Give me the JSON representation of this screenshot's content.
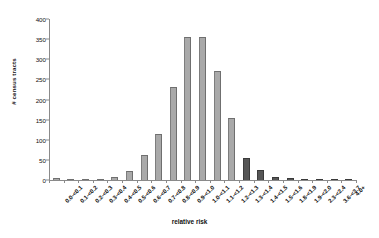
{
  "chart_data": {
    "type": "bar",
    "title": "",
    "xlabel": "relative risk",
    "ylabel": "# census tracts",
    "ylim": [
      0,
      400
    ],
    "yticks": [
      0,
      50,
      100,
      150,
      200,
      250,
      300,
      350,
      400
    ],
    "grid": false,
    "legend": false,
    "categories": [
      "0.0-<0.1",
      "0.1-<0.2",
      "0.2-<0.3",
      "0.3-<0.4",
      "0.4-<0.5",
      "0.5-<0.6",
      "0.6-<0.7",
      "0.7-<0.8",
      "0.8-<0.9",
      "0.9-<1.0",
      "1.0-<1.1",
      "1.1-<1.2",
      "1.2-<1.3",
      "1.3-<1.4",
      "1.4-<1.5",
      "1.5-<1.6",
      "1.8-<1.9",
      "1.9-<2.0",
      "2.3-<2.4",
      "3.6-<3.7",
      "4.0+"
    ],
    "values": [
      4,
      2,
      1,
      2,
      8,
      22,
      62,
      115,
      231,
      355,
      355,
      272,
      155,
      55,
      25,
      8,
      4,
      3,
      2,
      1,
      1
    ],
    "bar_colors": [
      "#a9a9a9",
      "#a9a9a9",
      "#a9a9a9",
      "#a9a9a9",
      "#a9a9a9",
      "#a9a9a9",
      "#a9a9a9",
      "#a9a9a9",
      "#a9a9a9",
      "#a9a9a9",
      "#a9a9a9",
      "#a9a9a9",
      "#a9a9a9",
      "#565656",
      "#565656",
      "#565656",
      "#565656",
      "#565656",
      "#565656",
      "#565656",
      "#565656"
    ]
  },
  "colors": {
    "bar_light": "#a9a9a9",
    "bar_dark": "#565656",
    "axis": "#8a8a8a",
    "text": "#111111",
    "background": "#ffffff"
  }
}
